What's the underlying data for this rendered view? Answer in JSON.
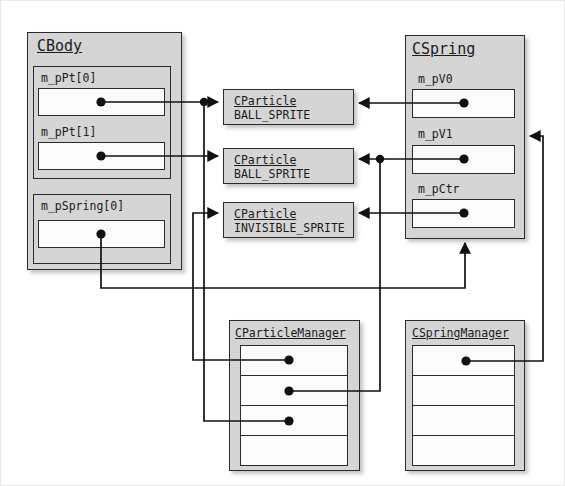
{
  "diagram": {
    "kind": "uml-object-pointer-diagram",
    "background": "#ffffff",
    "box_fill": "#d5d5d5",
    "slot_fill": "#fbfbfb",
    "line_color": "#111111"
  },
  "cbody": {
    "title": "CBody",
    "members": [
      {
        "label": "m_pPt[0]"
      },
      {
        "label": "m_pPt[1]"
      },
      {
        "label": "m_pSpring[0]"
      }
    ]
  },
  "cspring": {
    "title": "CSpring",
    "members": [
      {
        "label": "m_pV0"
      },
      {
        "label": "m_pV1"
      },
      {
        "label": "m_pCtr"
      }
    ]
  },
  "particles": [
    {
      "title": "CParticle",
      "sprite": "BALL_SPRITE"
    },
    {
      "title": "CParticle",
      "sprite": "BALL_SPRITE"
    },
    {
      "title": "CParticle",
      "sprite": "INVISIBLE_SPRITE"
    }
  ],
  "particle_manager": {
    "title": "CParticleManager",
    "slots": [
      "",
      "",
      "",
      ""
    ]
  },
  "spring_manager": {
    "title": "CSpringManager",
    "slots": [
      "",
      "",
      "",
      ""
    ]
  }
}
